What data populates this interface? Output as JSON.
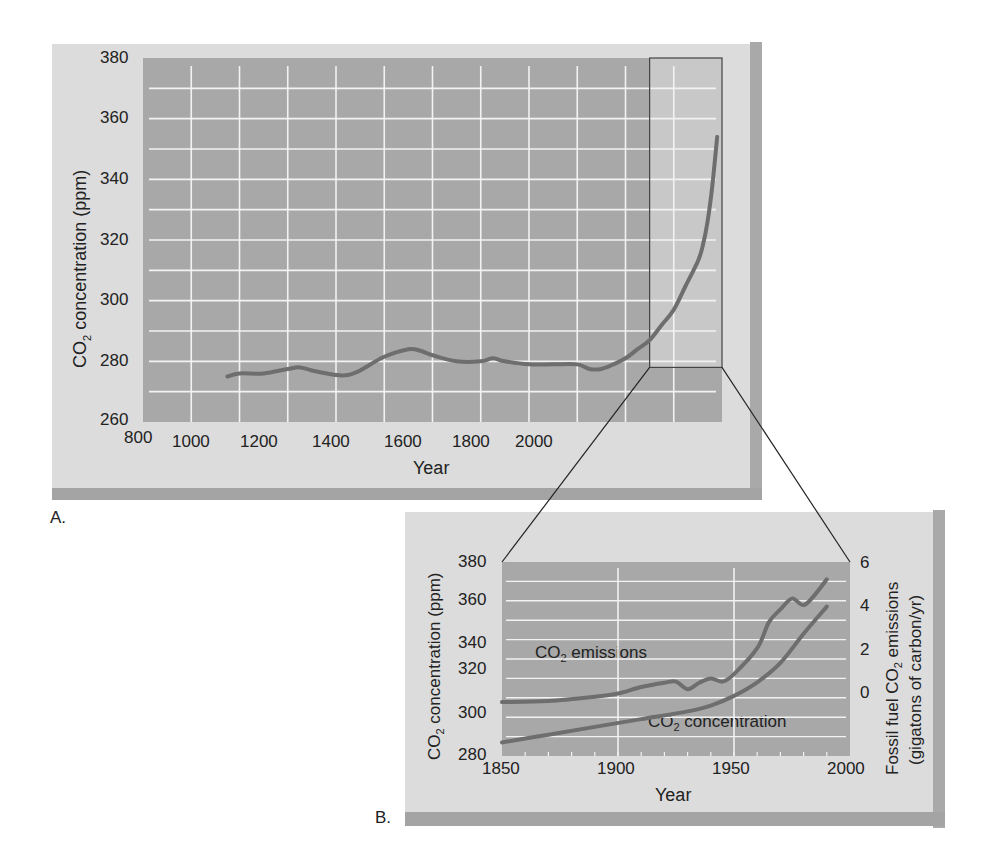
{
  "panels": {
    "a": {
      "label": "A.",
      "ylabel_prefix": "CO",
      "ylabel_sub": "2",
      "ylabel_suffix": " concentration (ppm)",
      "xlabel": "Year",
      "yticks": [
        "380",
        "360",
        "340",
        "320",
        "300",
        "280",
        "260"
      ],
      "xticks": [
        "800",
        "1000",
        "1200",
        "1400",
        "1600",
        "1800",
        "2000"
      ]
    },
    "b": {
      "label": "B.",
      "ylabel_prefix": "CO",
      "ylabel_sub": "2",
      "ylabel_suffix": " concentration (ppm)",
      "y2label_line1_prefix": "Fossil fuel CO",
      "y2label_line1_sub": "2",
      "y2label_line1_suffix": " emissions",
      "y2label_line2": "(gigatons of carbon/yr)",
      "xlabel": "Year",
      "yticks": [
        "380",
        "360",
        "340",
        "320",
        "300",
        "280"
      ],
      "y2ticks": [
        "6",
        "4",
        "2",
        "0"
      ],
      "xticks": [
        "1850",
        "1900",
        "1950",
        "2000"
      ],
      "annotation_emissions_prefix": "CO",
      "annotation_emissions_sub": "2",
      "annotation_emissions_suffix": " emissions",
      "annotation_concentration_prefix": "CO",
      "annotation_concentration_sub": "2",
      "annotation_concentration_suffix": " concentration"
    }
  },
  "colors": {
    "panel_bg": "#dcdcdc",
    "plot_bg": "#a8a8a8",
    "highlight_bg": "#c8c8c8",
    "grid": "#f2f2f2",
    "line": "#6e6e6e",
    "connector": "#222222"
  },
  "chart_data": [
    {
      "type": "line",
      "title": "A.",
      "xlabel": "Year",
      "ylabel": "CO2 concentration (ppm)",
      "xlim": [
        800,
        2000
      ],
      "ylim": [
        260,
        380
      ],
      "grid": true,
      "highlight_region": {
        "x": [
          1850,
          2000
        ],
        "y": [
          278,
          380
        ]
      },
      "series": [
        {
          "name": "CO2 concentration",
          "x": [
            975,
            1000,
            1050,
            1100,
            1125,
            1150,
            1200,
            1225,
            1250,
            1300,
            1350,
            1375,
            1400,
            1450,
            1500,
            1525,
            1550,
            1600,
            1650,
            1700,
            1725,
            1750,
            1775,
            1800,
            1825,
            1850,
            1875,
            1900,
            1925,
            1950,
            1960,
            1970,
            1980,
            1990
          ],
          "y": [
            275,
            276,
            276,
            277.5,
            278,
            277,
            275.5,
            275.5,
            277,
            281.5,
            284,
            283.5,
            282,
            280,
            280,
            281,
            280,
            279,
            279,
            279,
            277.5,
            277.5,
            279,
            281,
            284,
            287,
            292,
            297,
            305,
            313,
            318,
            326,
            338,
            354
          ]
        }
      ]
    },
    {
      "type": "line",
      "title": "B.",
      "xlabel": "Year",
      "ylabel": "CO2 concentration (ppm)",
      "y2label": "Fossil fuel CO2 emissions (gigatons of carbon/yr)",
      "xlim": [
        1850,
        2000
      ],
      "ylim": [
        280,
        380
      ],
      "y2lim": [
        -2,
        7
      ],
      "grid": true,
      "series": [
        {
          "name": "CO2 concentration",
          "axis": "left",
          "x": [
            1850,
            1870,
            1890,
            1910,
            1930,
            1940,
            1950,
            1960,
            1970,
            1980,
            1990
          ],
          "y": [
            287,
            291,
            295,
            299,
            303,
            306,
            311,
            318,
            328,
            343,
            357
          ]
        },
        {
          "name": "CO2 emissions",
          "axis": "right",
          "x": [
            1850,
            1870,
            1890,
            1900,
            1910,
            1920,
            1925,
            1930,
            1935,
            1940,
            1945,
            1950,
            1960,
            1965,
            1970,
            1975,
            1980,
            1985,
            1990
          ],
          "y": [
            0.5,
            0.55,
            0.75,
            0.9,
            1.2,
            1.4,
            1.45,
            1.1,
            1.4,
            1.6,
            1.45,
            1.8,
            3.0,
            4.2,
            4.8,
            5.3,
            5.0,
            5.5,
            6.2
          ]
        }
      ]
    }
  ]
}
